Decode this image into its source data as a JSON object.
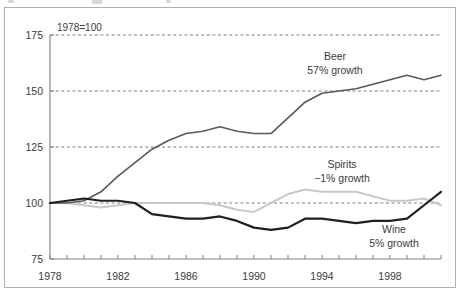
{
  "figure": {
    "base_note": "1978=100"
  },
  "chart_data": {
    "type": "line",
    "title": "",
    "subtitle": "",
    "xlabel": "",
    "ylabel": "",
    "note": "1978=100",
    "xlim": [
      1978,
      2001
    ],
    "ylim": [
      75,
      175
    ],
    "yticks": [
      75,
      100,
      125,
      150,
      175
    ],
    "ytick_labels": [
      "75",
      "100",
      "125",
      "150",
      "175"
    ],
    "gridlines_y": [
      100,
      125,
      150,
      175
    ],
    "grid": "horizontal-dashed",
    "xticks": [
      1978,
      1979,
      1980,
      1981,
      1982,
      1983,
      1984,
      1985,
      1986,
      1987,
      1988,
      1989,
      1990,
      1991,
      1992,
      1993,
      1994,
      1995,
      1996,
      1997,
      1998,
      1999,
      2000,
      2001
    ],
    "xtick_labels_shown": [
      "1978",
      "1982",
      "1986",
      "1990",
      "1994",
      "1998"
    ],
    "xtick_labels_years": [
      1978,
      1982,
      1986,
      1990,
      1994,
      1998
    ],
    "legend": "inline-annotations",
    "x": [
      1978,
      1979,
      1980,
      1981,
      1982,
      1983,
      1984,
      1985,
      1986,
      1987,
      1988,
      1989,
      1990,
      1991,
      1992,
      1993,
      1994,
      1995,
      1996,
      1997,
      1998,
      1999,
      2000,
      2001
    ],
    "series": [
      {
        "name": "Beer",
        "label": "Beer",
        "growth_label": "57% growth",
        "color": "#595959",
        "width": 1.6,
        "values": [
          100,
          100,
          101,
          105,
          112,
          118,
          124,
          128,
          131,
          132,
          134,
          132,
          131,
          131,
          138,
          145,
          149,
          150,
          151,
          153,
          155,
          157,
          155,
          157
        ]
      },
      {
        "name": "Spirits",
        "label": "Spirits",
        "growth_label": "−1% growth",
        "color": "#c9c9c9",
        "width": 2.0,
        "values": [
          100,
          100,
          99,
          98,
          99,
          100,
          100,
          100,
          100,
          100,
          99,
          97,
          96,
          100,
          104,
          106,
          105,
          105,
          105,
          103,
          101,
          101,
          102,
          99
        ]
      },
      {
        "name": "Wine",
        "label": "Wine",
        "growth_label": "5% growth",
        "color": "#1f1f1f",
        "width": 2.2,
        "values": [
          100,
          101,
          102,
          101,
          101,
          100,
          95,
          94,
          93,
          93,
          94,
          92,
          89,
          88,
          89,
          93,
          93,
          92,
          91,
          92,
          92,
          93,
          99,
          105
        ]
      }
    ],
    "annotations": [
      {
        "text": "Beer",
        "sub": "57% growth",
        "x": 1994,
        "y": 164
      },
      {
        "text": "Spirits",
        "sub": "−1% growth",
        "x": 1994.6,
        "y": 115
      },
      {
        "text": "Wine",
        "sub": "5% growth",
        "x": 1997.6,
        "y": 85
      }
    ]
  }
}
